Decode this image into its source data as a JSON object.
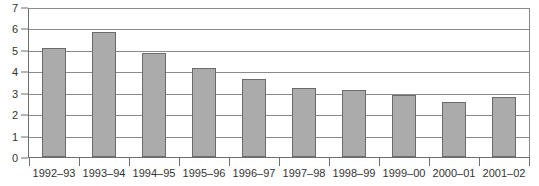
{
  "chart_data": {
    "type": "bar",
    "title": "",
    "subtitle": "",
    "xlabel": "",
    "ylabel": "",
    "categories": [
      "1992–93",
      "1993–94",
      "1994–95",
      "1995–96",
      "1996–97",
      "1997–98",
      "1998–99",
      "1999–00",
      "2000–01",
      "2001–02"
    ],
    "values": [
      5.15,
      5.9,
      4.92,
      4.22,
      3.67,
      3.25,
      3.15,
      2.95,
      2.58,
      2.82
    ],
    "ylim": [
      0,
      7
    ],
    "ytick_labels": [
      "0",
      "1",
      "2",
      "3",
      "4",
      "5",
      "6",
      "7"
    ],
    "ytick_values": [
      0,
      1,
      2,
      3,
      4,
      5,
      6,
      7
    ],
    "grid": true,
    "legend": false,
    "legend_position": "none",
    "bar_color": "#ababab",
    "bar_border_color": "#6b6b6b",
    "gridline_color": "#8a8a8a",
    "axis_color": "#6e6e6e",
    "background_color": "#ffffff",
    "text_color": "#333333"
  }
}
